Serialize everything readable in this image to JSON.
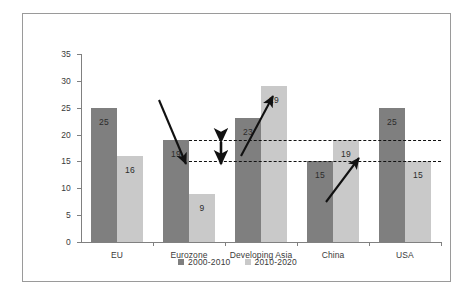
{
  "chart_data": {
    "type": "bar",
    "title": "",
    "subtitle": "",
    "xlabel": "",
    "ylabel": "",
    "ylim": [
      0,
      35
    ],
    "ytick_step": 5,
    "yticks": [
      "0",
      "5",
      "10",
      "15",
      "20",
      "25",
      "30",
      "35"
    ],
    "grid": false,
    "legend_position": "bottom-center",
    "categories": [
      "EU",
      "Eurozone",
      "Developing Asia",
      "China",
      "USA"
    ],
    "series": [
      {
        "name": "2000-2010",
        "color": "#7f7f7f",
        "values": [
          25,
          19,
          23,
          15,
          25
        ]
      },
      {
        "name": "2010-2020",
        "color": "#c9c9c9",
        "values": [
          16,
          9,
          29,
          19,
          15
        ]
      }
    ],
    "data_labels": {
      "2000-2010": [
        "25",
        "19",
        "23",
        "15",
        "25"
      ],
      "2010-2020": [
        "16",
        "9",
        "29",
        "19",
        "15"
      ]
    },
    "reference_lines": [
      {
        "name": "upper-dashed-line",
        "value": 19,
        "style": "dashed",
        "color": "#111111"
      },
      {
        "name": "lower-dashed-line",
        "value": 15,
        "style": "dashed",
        "color": "#111111"
      }
    ],
    "annotations": [
      {
        "name": "eurozone-down-arrow",
        "direction": "down",
        "note": "decline over Eurozone bars"
      },
      {
        "name": "gap-double-arrow",
        "direction": "both",
        "note": "vertical gap between 19 and 15 reference lines"
      },
      {
        "name": "developing-asia-up-arrow",
        "direction": "up",
        "note": "rise over Developing Asia bars"
      },
      {
        "name": "china-up-arrow",
        "direction": "up",
        "note": "rise over China bars"
      }
    ]
  },
  "legend": {
    "items": [
      {
        "label": "2000-2010",
        "color": "#7f7f7f"
      },
      {
        "label": "2010-2020",
        "color": "#c9c9c9"
      }
    ]
  },
  "axes": {
    "y": {
      "ticks": [
        "0",
        "5",
        "10",
        "15",
        "20",
        "25",
        "30",
        "35"
      ]
    },
    "x": {
      "ticks": [
        "EU",
        "Eurozone",
        "Developing Asia",
        "China",
        "USA"
      ]
    }
  },
  "colors": {
    "series_2000_2010": "#7f7f7f",
    "series_2010_2020": "#c9c9c9",
    "axis": "#808080",
    "frame": "#9a9a9a",
    "annotation": "#111111",
    "background": "#ffffff"
  }
}
